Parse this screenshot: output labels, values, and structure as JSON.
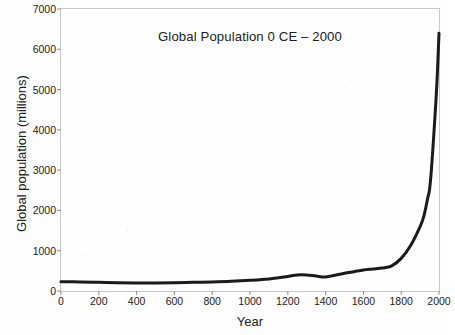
{
  "chart_data": {
    "type": "line",
    "title": "Global Population 0 CE – 2000",
    "xlabel": "Year",
    "ylabel": "Global population (millions)",
    "xlim": [
      0,
      2000
    ],
    "ylim": [
      0,
      7000
    ],
    "grid": false,
    "legend": "none",
    "line_color": "#1b1b1b",
    "line_width_px": 3,
    "x_ticks": [
      0,
      200,
      400,
      600,
      800,
      1000,
      1200,
      1400,
      1600,
      1800,
      2000
    ],
    "y_ticks": [
      0,
      1000,
      2000,
      3000,
      4000,
      5000,
      6000,
      7000
    ],
    "x_tick_labels": [
      "0",
      "200",
      "400",
      "600",
      "800",
      "1000",
      "1200",
      "1400",
      "1600",
      "1800",
      "2000"
    ],
    "y_tick_labels": [
      "0",
      "1000",
      "2000",
      "3000",
      "4000",
      "5000",
      "6000",
      "7000"
    ],
    "series": [
      {
        "name": "Global population",
        "x": [
          0,
          100,
          200,
          300,
          400,
          500,
          600,
          700,
          800,
          900,
          1000,
          1100,
          1200,
          1250,
          1300,
          1350,
          1400,
          1450,
          1500,
          1550,
          1600,
          1650,
          1700,
          1750,
          1800,
          1850,
          1900,
          1920,
          1940,
          1950,
          1960,
          1970,
          1980,
          1990,
          2000
        ],
        "values": [
          230,
          225,
          215,
          205,
          200,
          200,
          205,
          215,
          225,
          240,
          265,
          300,
          360,
          400,
          400,
          370,
          350,
          390,
          440,
          480,
          520,
          545,
          570,
          625,
          810,
          1130,
          1600,
          1860,
          2300,
          2520,
          3020,
          3700,
          4430,
          5260,
          6400
        ]
      }
    ]
  },
  "axes": {
    "y_title": "Global population (millions)",
    "x_title": "Year"
  }
}
